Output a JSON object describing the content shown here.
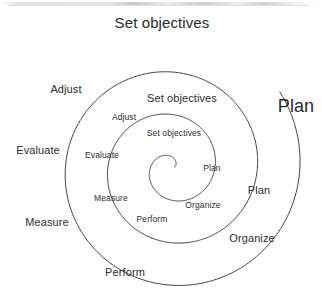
{
  "diagram": {
    "type": "spiral-cycle",
    "center": {
      "x": 172,
      "y": 168
    },
    "stroke_color": "#3a3a3a",
    "text_color": "#2b2b2b",
    "background_color": "#ffffff",
    "turns": 3,
    "stage_names": [
      "Set objectives",
      "Plan",
      "Organize",
      "Perform",
      "Measure",
      "Evaluate",
      "Adjust"
    ],
    "rings": [
      {
        "name": "inner-ring",
        "index": 1,
        "font_size_px": 8.5,
        "labels": [
          {
            "id": "inner-set-objectives",
            "text": "Set objectives",
            "x": 174,
            "y": 133
          },
          {
            "id": "inner-plan",
            "text": "Plan",
            "x": 212,
            "y": 168
          },
          {
            "id": "inner-organize",
            "text": "Organize",
            "x": 203,
            "y": 205
          },
          {
            "id": "inner-perform",
            "text": "Perform",
            "x": 152,
            "y": 219
          },
          {
            "id": "inner-measure",
            "text": "Measure",
            "x": 111,
            "y": 198
          },
          {
            "id": "inner-evaluate",
            "text": "Evaluate",
            "x": 102,
            "y": 155
          },
          {
            "id": "inner-adjust",
            "text": "Adjust",
            "x": 124,
            "y": 117
          }
        ]
      },
      {
        "name": "middle-ring",
        "index": 2,
        "font_size_px": 11,
        "labels": [
          {
            "id": "mid-set-objectives",
            "text": "Set objectives",
            "x": 182,
            "y": 98
          },
          {
            "id": "mid-plan",
            "text": "Plan",
            "x": 259,
            "y": 190
          },
          {
            "id": "mid-organize",
            "text": "Organize",
            "x": 252,
            "y": 238
          },
          {
            "id": "mid-perform",
            "text": "Perform",
            "x": 125,
            "y": 272
          },
          {
            "id": "mid-measure",
            "text": "Measure",
            "x": 47,
            "y": 222
          },
          {
            "id": "mid-evaluate",
            "text": "Evaluate",
            "x": 38,
            "y": 150
          },
          {
            "id": "mid-adjust",
            "text": "Adjust",
            "x": 66,
            "y": 89
          }
        ]
      },
      {
        "name": "outer-ring",
        "index": 3,
        "font_size_px": 15,
        "labels": [
          {
            "id": "outer-set-objectives",
            "text": "Set objectives",
            "x": 162,
            "y": 22
          },
          {
            "id": "outer-plan",
            "text": "Plan",
            "x": 296,
            "y": 106
          }
        ]
      }
    ]
  }
}
